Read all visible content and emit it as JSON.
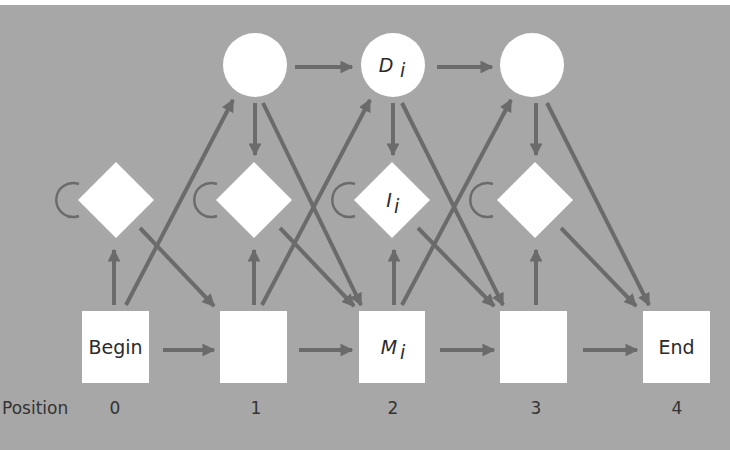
{
  "diagram": {
    "type": "profile-hmm",
    "colors": {
      "background": "#a7a7a7",
      "node_fill": "#ffffff",
      "edge": "#6b6b6b",
      "text": "#2b2b2b"
    },
    "delete_states": [
      {
        "id": "D1",
        "label": "",
        "position": 1
      },
      {
        "id": "D2",
        "label": "D",
        "subscript": "i",
        "position": 2
      },
      {
        "id": "D3",
        "label": "",
        "position": 3
      }
    ],
    "insert_states": [
      {
        "id": "I0",
        "label": "",
        "position": 0
      },
      {
        "id": "I1",
        "label": "",
        "position": 1
      },
      {
        "id": "I2",
        "label": "I",
        "subscript": "i",
        "position": 2
      },
      {
        "id": "I3",
        "label": "",
        "position": 3
      }
    ],
    "match_states": [
      {
        "id": "Begin",
        "label": "Begin",
        "position": 0
      },
      {
        "id": "M1",
        "label": "",
        "position": 1
      },
      {
        "id": "M2",
        "label": "M",
        "subscript": "i",
        "position": 2
      },
      {
        "id": "M3",
        "label": "",
        "position": 3
      },
      {
        "id": "End",
        "label": "End",
        "position": 4
      }
    ],
    "position_row": {
      "title": "Position",
      "values": [
        "0",
        "1",
        "2",
        "3",
        "4"
      ]
    }
  }
}
